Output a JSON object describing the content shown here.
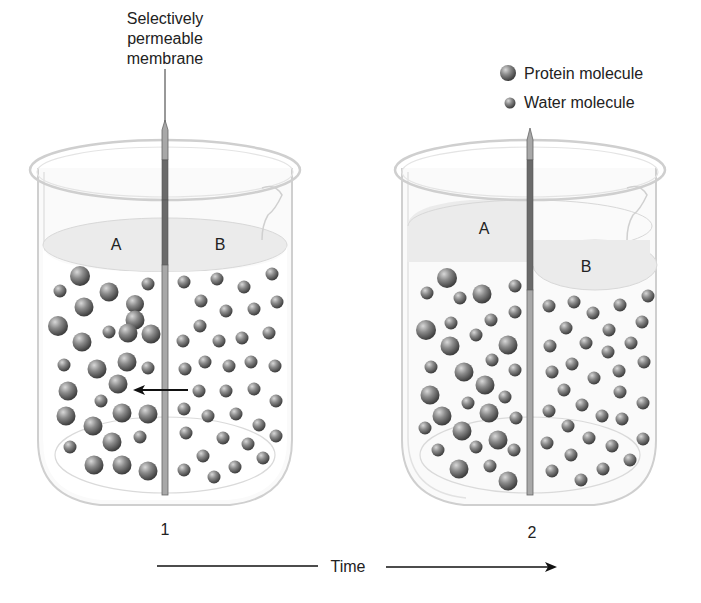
{
  "title_label": {
    "line1": "Selectively",
    "line2": "permeable",
    "line3": "membrane"
  },
  "legend": {
    "items": [
      {
        "label": "Protein molecule",
        "icon": "large-sphere"
      },
      {
        "label": "Water molecule",
        "icon": "small-sphere"
      }
    ]
  },
  "beakers": [
    {
      "number": "1",
      "compartment_left": "A",
      "compartment_right": "B",
      "note": "Equal fluid levels; arrow shows water moving from B to A"
    },
    {
      "number": "2",
      "compartment_left": "A",
      "compartment_right": "B",
      "note": "Fluid level in A higher than in B"
    }
  ],
  "time_axis": {
    "label": "Time"
  },
  "colors": {
    "glass": "#d6d6d6",
    "fluid": "#ececec",
    "membrane_dark": "#6a6a6a",
    "membrane_light": "#a8a8a8",
    "sphere": "#7a7a7a",
    "text": "#222222"
  }
}
